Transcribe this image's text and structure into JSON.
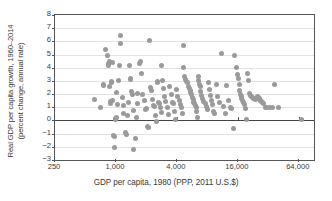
{
  "chart_data": {
    "type": "scatter",
    "title": "",
    "xlabel": "GDP per capita, 1980 (PPP, 2011 U.S.$)",
    "ylabel_line1": "Real GDP per capita growth, 1960–2014",
    "ylabel_line2": "(percent change, annual rate)",
    "x_scale": "log",
    "x_tick_labels": [
      "250",
      "1,000",
      "4,000",
      "16,000",
      "64,000"
    ],
    "x_tick_values": [
      250,
      1000,
      4000,
      16000,
      64000
    ],
    "xlim": [
      250,
      90510
    ],
    "y_tick_labels": [
      "8",
      "7",
      "6",
      "5",
      "4",
      "3",
      "2",
      "1",
      "0",
      "−1",
      "−2",
      "−3"
    ],
    "y_tick_values": [
      8,
      7,
      6,
      5,
      4,
      3,
      2,
      1,
      0,
      -1,
      -2,
      -3
    ],
    "ylim": [
      -3,
      8
    ],
    "grid": "horizontal",
    "zero_line": true,
    "legend": "none",
    "marker_color": "#9a9a9a",
    "marker_size_px": 5,
    "n_points": 172,
    "points": [
      [
        620,
        1.6
      ],
      [
        700,
        1.0
      ],
      [
        745,
        2.65
      ],
      [
        760,
        2.7
      ],
      [
        790,
        5.4
      ],
      [
        820,
        4.9
      ],
      [
        840,
        4.3
      ],
      [
        845,
        4.15
      ],
      [
        860,
        4.45
      ],
      [
        865,
        2.6
      ],
      [
        880,
        1.45
      ],
      [
        890,
        1.3
      ],
      [
        900,
        2.85
      ],
      [
        910,
        2.95
      ],
      [
        915,
        1.55
      ],
      [
        930,
        4.4
      ],
      [
        950,
        -1.15
      ],
      [
        960,
        -1.2
      ],
      [
        975,
        -2.05
      ],
      [
        990,
        0.15
      ],
      [
        1000,
        0.1
      ],
      [
        1010,
        0.25
      ],
      [
        1020,
        2.1
      ],
      [
        1030,
        1.2
      ],
      [
        1050,
        3.0
      ],
      [
        1080,
        4.2
      ],
      [
        1100,
        5.85
      ],
      [
        1120,
        6.45
      ],
      [
        1150,
        1.75
      ],
      [
        1180,
        0.55
      ],
      [
        1200,
        1.1
      ],
      [
        1230,
        -0.9
      ],
      [
        1260,
        -1.05
      ],
      [
        1300,
        0.4
      ],
      [
        1320,
        1.35
      ],
      [
        1350,
        4.2
      ],
      [
        1380,
        3.1
      ],
      [
        1400,
        3.2
      ],
      [
        1420,
        2.2
      ],
      [
        1450,
        1.95
      ],
      [
        1480,
        0.75
      ],
      [
        1500,
        -2.2
      ],
      [
        1550,
        -1.35
      ],
      [
        1600,
        0.2
      ],
      [
        1620,
        1.25
      ],
      [
        1650,
        2.05
      ],
      [
        1700,
        4.35
      ],
      [
        1750,
        4.45
      ],
      [
        1800,
        3.6
      ],
      [
        1850,
        2.0
      ],
      [
        1900,
        1.5
      ],
      [
        1950,
        0.85
      ],
      [
        2000,
        0.9
      ],
      [
        2050,
        -0.45
      ],
      [
        2100,
        -0.55
      ],
      [
        2150,
        6.05
      ],
      [
        2200,
        2.5
      ],
      [
        2250,
        2.25
      ],
      [
        2300,
        1.6
      ],
      [
        2350,
        1.15
      ],
      [
        2400,
        1.05
      ],
      [
        2450,
        0.35
      ],
      [
        2500,
        -0.1
      ],
      [
        2550,
        2.9
      ],
      [
        2600,
        2.95
      ],
      [
        2650,
        1.4
      ],
      [
        2700,
        1.3
      ],
      [
        2750,
        0.95
      ],
      [
        2800,
        0.6
      ],
      [
        2850,
        4.2
      ],
      [
        2900,
        3.0
      ],
      [
        2950,
        2.4
      ],
      [
        3000,
        1.85
      ],
      [
        3100,
        1.45
      ],
      [
        3200,
        1.0
      ],
      [
        3300,
        0.45
      ],
      [
        3400,
        2.55
      ],
      [
        3500,
        2.0
      ],
      [
        3600,
        1.35
      ],
      [
        3700,
        1.25
      ],
      [
        3800,
        0.7
      ],
      [
        3900,
        0.1
      ],
      [
        4000,
        2.35
      ],
      [
        4100,
        1.8
      ],
      [
        4200,
        1.55
      ],
      [
        4300,
        1.2
      ],
      [
        4400,
        1.0
      ],
      [
        4500,
        0.5
      ],
      [
        4600,
        5.65
      ],
      [
        4700,
        4.05
      ],
      [
        4800,
        3.35
      ],
      [
        4900,
        3.1
      ],
      [
        5000,
        2.95
      ],
      [
        5100,
        2.85
      ],
      [
        5200,
        2.6
      ],
      [
        5300,
        2.45
      ],
      [
        5400,
        2.3
      ],
      [
        5500,
        2.1
      ],
      [
        5600,
        1.95
      ],
      [
        5700,
        1.75
      ],
      [
        5800,
        1.6
      ],
      [
        5900,
        1.4
      ],
      [
        6000,
        1.25
      ],
      [
        6100,
        1.1
      ],
      [
        6200,
        0.95
      ],
      [
        6300,
        0.7
      ],
      [
        6400,
        0.25
      ],
      [
        6500,
        3.3
      ],
      [
        6600,
        3.0
      ],
      [
        6700,
        2.75
      ],
      [
        6800,
        2.55
      ],
      [
        6900,
        2.2
      ],
      [
        7000,
        1.9
      ],
      [
        7200,
        1.65
      ],
      [
        7400,
        1.45
      ],
      [
        7600,
        1.3
      ],
      [
        7800,
        1.05
      ],
      [
        8000,
        0.85
      ],
      [
        8200,
        2.9
      ],
      [
        8400,
        2.35
      ],
      [
        8600,
        1.9
      ],
      [
        8800,
        1.55
      ],
      [
        9000,
        1.2
      ],
      [
        9200,
        0.65
      ],
      [
        9500,
        0.5
      ],
      [
        9800,
        2.75
      ],
      [
        10000,
        1.85
      ],
      [
        10500,
        1.35
      ],
      [
        11000,
        5.05
      ],
      [
        11500,
        1.05
      ],
      [
        12000,
        0.55
      ],
      [
        12500,
        2.65
      ],
      [
        13000,
        1.5
      ],
      [
        13500,
        0.95
      ],
      [
        14000,
        0.9
      ],
      [
        14500,
        -0.6
      ],
      [
        15000,
        4.9
      ],
      [
        15500,
        4.05
      ],
      [
        16000,
        3.5
      ],
      [
        16200,
        3.15
      ],
      [
        16500,
        2.7
      ],
      [
        16800,
        2.3
      ],
      [
        17000,
        1.95
      ],
      [
        17200,
        1.8
      ],
      [
        17500,
        1.7
      ],
      [
        17800,
        1.55
      ],
      [
        18000,
        1.35
      ],
      [
        18500,
        1.2
      ],
      [
        19000,
        0.9
      ],
      [
        19500,
        0.1
      ],
      [
        20000,
        3.6
      ],
      [
        20500,
        3.05
      ],
      [
        21000,
        2.05
      ],
      [
        21500,
        1.9
      ],
      [
        22000,
        1.8
      ],
      [
        22500,
        1.75
      ],
      [
        23000,
        1.7
      ],
      [
        23500,
        1.65
      ],
      [
        24000,
        1.6
      ],
      [
        24500,
        1.7
      ],
      [
        25000,
        1.8
      ],
      [
        25500,
        1.75
      ],
      [
        26000,
        1.65
      ],
      [
        26500,
        1.55
      ],
      [
        27000,
        1.5
      ],
      [
        27500,
        1.45
      ],
      [
        28000,
        1.35
      ],
      [
        29000,
        1.25
      ],
      [
        30000,
        1.0
      ],
      [
        31000,
        0.95
      ],
      [
        33000,
        1.0
      ],
      [
        35000,
        0.95
      ],
      [
        37000,
        2.7
      ],
      [
        40000,
        1.0
      ],
      [
        68000,
        0.1
      ]
    ]
  }
}
